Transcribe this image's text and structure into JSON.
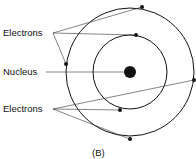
{
  "labels": {
    "electrons_top": "Electrons",
    "nucleus": "Nucleus",
    "electrons_bottom": "Electrons",
    "caption": "(B)"
  },
  "diagram": {
    "type": "atom-model",
    "nucleus": {
      "cx": 130,
      "cy": 72,
      "r": 6
    },
    "orbits": [
      {
        "r": 37
      },
      {
        "r": 64
      }
    ],
    "electrons": [
      {
        "x": 142,
        "y": 7
      },
      {
        "x": 136,
        "y": 35
      },
      {
        "x": 66,
        "y": 64
      },
      {
        "x": 194,
        "y": 80
      },
      {
        "x": 120,
        "y": 110
      },
      {
        "x": 130,
        "y": 139
      }
    ],
    "color": "#111111"
  }
}
